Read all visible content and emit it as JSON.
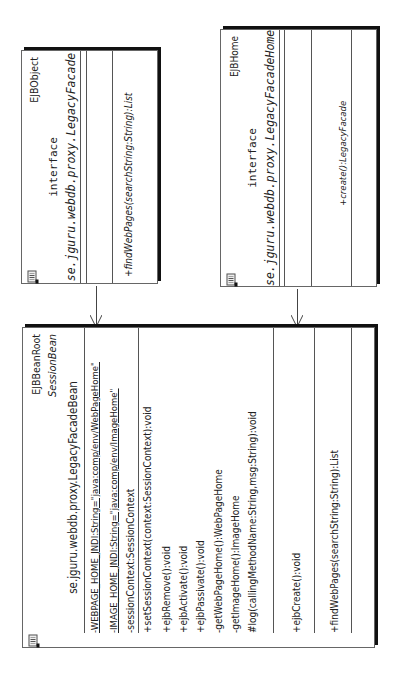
{
  "diagram": {
    "orientation": "rotated -90deg",
    "ejb_object": {
      "stereotype_right": "EJBObject",
      "kind": "interface",
      "name": "se.jguru.webdb.proxy.LegacyFacade",
      "operations": [
        "+findWebPages(searchString:String):List"
      ]
    },
    "ejb_home": {
      "stereotype_right": "EJBHome",
      "kind": "interface",
      "name": "se.jguru.webdb.proxy.LegacyFacadeHome",
      "operations": [
        "+create():LegacyFacade"
      ]
    },
    "bean": {
      "stereotype_right": "EJBBeanRoot",
      "kind": "SessionBean",
      "name": "se.jguru.webdb.proxy.LegacyFacadeBean",
      "attributes": [
        "-WEBPAGE_HOME_JNDI:String=\"java:comp/env/WebPageHome\"",
        "-IMAGE_HOME_JNDI:String=\"java:comp/env/ImageHome\"",
        "-sessionContext:SessionContext"
      ],
      "operations": [
        "+setSessionContext(context:SessionContext):void",
        "+ejbRemove():void",
        "+ejbActivate():void",
        "+ejbPassivate():void",
        "-getWebPageHome():WebPageHome",
        "-getImageHome():ImageHome",
        "#log(callingMethodName:String,msg:String):void"
      ],
      "create_operations": [
        "+ejbCreate():void"
      ],
      "business_operations": [
        "+findWebPages(searchString:String):List"
      ]
    },
    "relations": [
      {
        "from": "LegacyFacade",
        "to": "LegacyFacadeBean",
        "type": "dependency"
      },
      {
        "from": "LegacyFacadeHome",
        "to": "LegacyFacadeBean",
        "type": "dependency"
      }
    ]
  }
}
